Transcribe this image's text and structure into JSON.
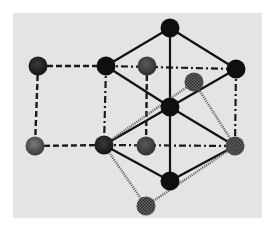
{
  "diagram": {
    "type": "crystal-lattice",
    "canvas": {
      "width": 273,
      "height": 232,
      "background": "#ffffff"
    },
    "panel": {
      "x": 13,
      "y": 13,
      "width": 249,
      "height": 205,
      "fill": "#e4e4e4"
    },
    "styles": {
      "solid": {
        "stroke": "#111111",
        "width": 2.2,
        "dash": ""
      },
      "dashed": {
        "stroke": "#1a1a1a",
        "width": 2.4,
        "dash": "6 3"
      },
      "dashdot": {
        "stroke": "#1a1a1a",
        "width": 2.2,
        "dash": "7 3 2 3"
      },
      "dotted": {
        "stroke": "#555555",
        "width": 2.4,
        "dash": "1 1.2"
      }
    },
    "atom_fills": {
      "black": "#0f0f0f",
      "dark": "#2e2e2e",
      "grey": "#444444",
      "mottled": "#555555",
      "checker": "#4a4a4a"
    },
    "atoms": [
      {
        "id": "A1",
        "x": 38,
        "y": 66,
        "r": 9.5,
        "kind": "dark"
      },
      {
        "id": "A2",
        "x": 106,
        "y": 66,
        "r": 9.5,
        "kind": "black"
      },
      {
        "id": "A3",
        "x": 147,
        "y": 66,
        "r": 9.5,
        "kind": "grey"
      },
      {
        "id": "A4",
        "x": 170,
        "y": 28,
        "r": 9.5,
        "kind": "black"
      },
      {
        "id": "A5",
        "x": 236,
        "y": 69,
        "r": 9.5,
        "kind": "black"
      },
      {
        "id": "A6",
        "x": 194,
        "y": 82,
        "r": 9.5,
        "kind": "checker"
      },
      {
        "id": "A7",
        "x": 170,
        "y": 107,
        "r": 9.5,
        "kind": "black"
      },
      {
        "id": "A8",
        "x": 35,
        "y": 146,
        "r": 9.5,
        "kind": "mottled"
      },
      {
        "id": "A9",
        "x": 104,
        "y": 145,
        "r": 9.5,
        "kind": "dark"
      },
      {
        "id": "A10",
        "x": 146,
        "y": 146,
        "r": 9.5,
        "kind": "grey"
      },
      {
        "id": "A11",
        "x": 235,
        "y": 146,
        "r": 9.5,
        "kind": "checker"
      },
      {
        "id": "A12",
        "x": 170,
        "y": 181,
        "r": 9.5,
        "kind": "black"
      },
      {
        "id": "A13",
        "x": 146,
        "y": 206,
        "r": 9.5,
        "kind": "checker"
      }
    ],
    "bonds": [
      {
        "from": "A4",
        "to": "A2",
        "style": "solid"
      },
      {
        "from": "A4",
        "to": "A5",
        "style": "solid"
      },
      {
        "from": "A4",
        "to": "A12",
        "style": "solid"
      },
      {
        "from": "A2",
        "to": "A7",
        "style": "solid"
      },
      {
        "from": "A5",
        "to": "A7",
        "style": "solid"
      },
      {
        "from": "A7",
        "to": "A9",
        "style": "solid"
      },
      {
        "from": "A7",
        "to": "A11",
        "style": "solid"
      },
      {
        "from": "A9",
        "to": "A12",
        "style": "solid"
      },
      {
        "from": "A12",
        "to": "A11",
        "style": "solid"
      },
      {
        "from": "A1",
        "to": "A2",
        "style": "dashed"
      },
      {
        "from": "A1",
        "to": "A8",
        "style": "dashed"
      },
      {
        "from": "A8",
        "to": "A9",
        "style": "dashed"
      },
      {
        "from": "A3",
        "to": "A10",
        "style": "dashed"
      },
      {
        "from": "A2",
        "to": "A5",
        "style": "dashdot"
      },
      {
        "from": "A2",
        "to": "A9",
        "style": "dashdot"
      },
      {
        "from": "A9",
        "to": "A11",
        "style": "dashdot"
      },
      {
        "from": "A5",
        "to": "A11",
        "style": "dashdot"
      },
      {
        "from": "A9",
        "to": "A6",
        "style": "dotted"
      },
      {
        "from": "A6",
        "to": "A11",
        "style": "dotted"
      },
      {
        "from": "A9",
        "to": "A13",
        "style": "dotted"
      },
      {
        "from": "A13",
        "to": "A11",
        "style": "dotted"
      }
    ]
  }
}
